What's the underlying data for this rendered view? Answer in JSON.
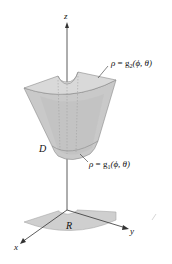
{
  "figure": {
    "type": "3d-solid-region-spherical-coordinates",
    "axes": {
      "z_label": "z",
      "x_label": "x",
      "y_label": "y"
    },
    "labels": {
      "outer_surface_rho": "ρ",
      "outer_surface_eq": " = g",
      "outer_surface_sub": "2",
      "outer_surface_args": "(ϕ, θ)",
      "inner_surface_rho": "ρ",
      "inner_surface_eq": " = g",
      "inner_surface_sub": "1",
      "inner_surface_args": "(ϕ, θ)",
      "solid": "D",
      "projection_region": "R"
    },
    "colors": {
      "solid_fill": "#c9c9c9",
      "solid_top": "#d8d8d8",
      "solid_edge": "#8a8a8a",
      "region_fill": "#cfcfcf",
      "axis": "#333333",
      "text": "#111111"
    }
  }
}
